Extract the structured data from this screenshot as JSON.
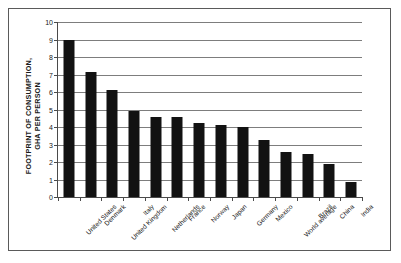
{
  "chart_data": {
    "type": "bar",
    "title": "",
    "subtitle": "",
    "xlabel": "",
    "ylabel": "FOOTPRINT OF CONSUMPTION, GHA PER PERSON",
    "ylabel_line1": "FOOTPRINT OF CONSUMPTION,",
    "ylabel_line2": "GHA PER PERSON",
    "ylim": [
      0,
      10
    ],
    "ytick_step": 1,
    "yticks": [
      "0",
      "1",
      "2",
      "3",
      "4",
      "5",
      "6",
      "7",
      "8",
      "9",
      "10"
    ],
    "grid": "horizontal",
    "legend": "none",
    "bar_color": "#121212",
    "categories": [
      "United States",
      "Denmark",
      "United Kingdom",
      "Italy",
      "Netherlands",
      "France",
      "Norway",
      "Japan",
      "Germany",
      "Mexico",
      "World average",
      "Brazil",
      "China",
      "India"
    ],
    "values": [
      9.0,
      7.15,
      6.1,
      4.9,
      4.6,
      4.6,
      4.25,
      4.1,
      4.0,
      3.25,
      2.6,
      2.45,
      1.9,
      0.85
    ]
  }
}
